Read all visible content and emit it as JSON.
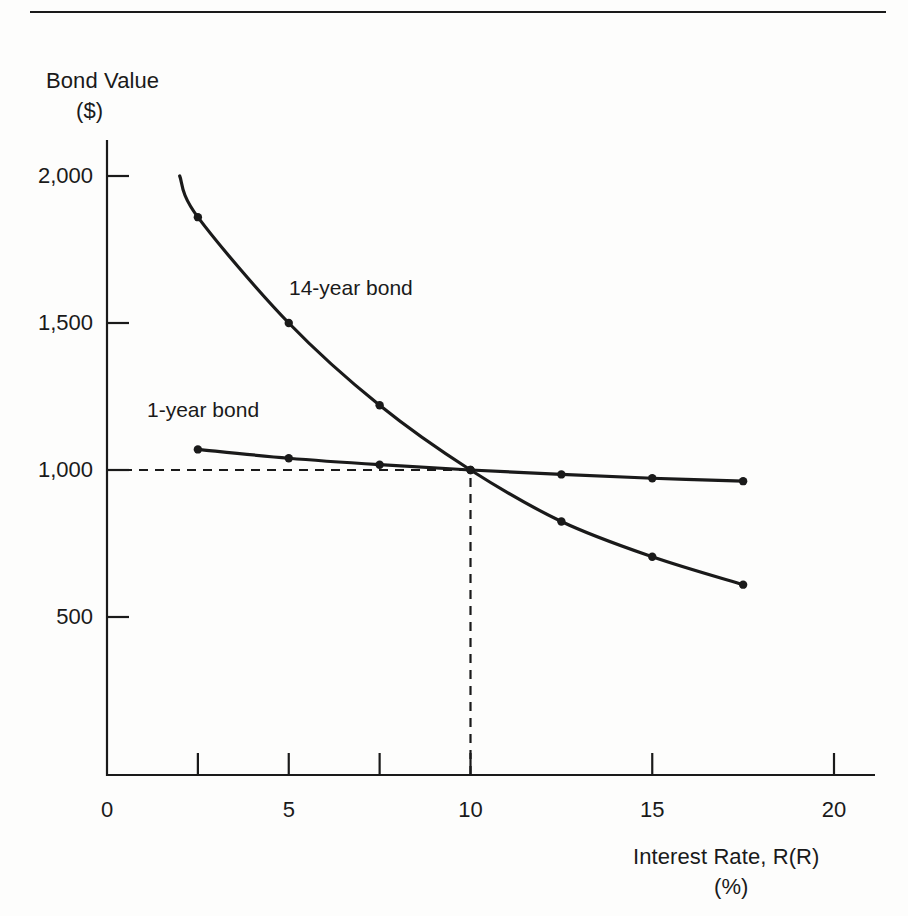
{
  "figure": {
    "background_color": "#fdfdfc",
    "ink_color": "#1a1a1a",
    "top_rule": "horizontal-rule"
  },
  "axis_titles": {
    "y_line1": "Bond Value",
    "y_line2": "($)",
    "x_line1": "Interest Rate, R(R)",
    "x_line2": "(%)"
  },
  "chart_data": {
    "type": "line",
    "title": "",
    "subtitle": "",
    "xlabel": "Interest Rate, R(R) (%)",
    "ylabel": "Bond Value ($)",
    "xlim": [
      0,
      21.5
    ],
    "ylim": [
      0,
      2150
    ],
    "grid": false,
    "legend_position": "inline-annotations",
    "x_ticks": [
      0,
      2.5,
      5,
      7.5,
      10,
      15,
      20
    ],
    "x_tick_labels": [
      "0",
      "",
      "5",
      "",
      "10",
      "15",
      "20"
    ],
    "y_ticks": [
      500,
      1000,
      1500,
      2000
    ],
    "y_tick_labels": [
      "500",
      "1,000",
      "1,500",
      "2,000"
    ],
    "annotations": [
      {
        "text": "14-year bond",
        "x": 8.0,
        "y": 1360
      },
      {
        "text": "1-year bond",
        "x": 1.1,
        "y": 930
      }
    ],
    "reference_lines": [
      {
        "name": "par-value-horizontal",
        "orientation": "horizontal",
        "value": 1000,
        "style": "dashed",
        "from_x": 0,
        "to_x": 10
      },
      {
        "name": "equilibrium-vertical",
        "orientation": "vertical",
        "value": 10,
        "style": "dashed",
        "from_y": 0,
        "to_y": 1000
      }
    ],
    "intersection_point": {
      "x": 10,
      "y": 1000,
      "label": "par value at coupon rate"
    },
    "series": [
      {
        "name": "14-year bond",
        "x": [
          2.0,
          2.5,
          5.0,
          7.5,
          10.0,
          12.5,
          15.0,
          17.5
        ],
        "values": [
          2000,
          1860,
          1500,
          1220,
          1000,
          825,
          705,
          610
        ],
        "markers": [
          false,
          true,
          true,
          true,
          true,
          true,
          true,
          true
        ]
      },
      {
        "name": "1-year bond",
        "x": [
          2.5,
          5.0,
          7.5,
          10.0,
          12.5,
          15.0,
          17.5
        ],
        "values": [
          1070,
          1040,
          1018,
          1000,
          985,
          972,
          962
        ],
        "markers": [
          true,
          true,
          true,
          true,
          true,
          true,
          true
        ]
      }
    ]
  }
}
